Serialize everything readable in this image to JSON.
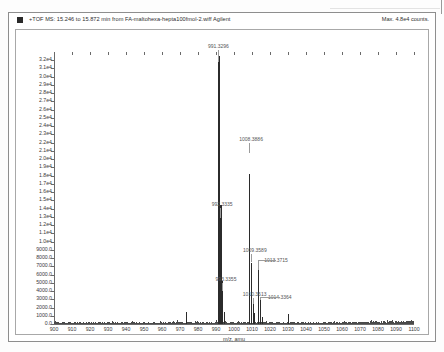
{
  "window": {
    "header": {
      "marker_icon": "filled-square-icon",
      "title": "+TOF MS: 15.246 to 15.872 min from FA-maltohexa-hepta100fmol-2.wiff Agilent",
      "max_counts": "Max. 4.8e4 counts."
    }
  },
  "chart_data": {
    "type": "line",
    "title": "+TOF MS: 15.246 to 15.872 min from FA-maltohexa-hepta100fmol-2.wiff Agilent",
    "subtitle": "Max. 4.8e4 counts.",
    "xlabel": "m/z, amu",
    "ylabel": "",
    "xlim": [
      900,
      1100
    ],
    "ylim": [
      0,
      33000
    ],
    "grid": false,
    "legend": "none",
    "x_ticks": [
      900,
      910,
      920,
      930,
      940,
      950,
      960,
      970,
      980,
      990,
      1000,
      1010,
      1020,
      1030,
      1040,
      1050,
      1060,
      1070,
      1080,
      1090,
      1100
    ],
    "y_ticks": [
      {
        "value": 0,
        "label": "0.0"
      },
      {
        "value": 1000,
        "label": "1000.0"
      },
      {
        "value": 2000,
        "label": "2000.0"
      },
      {
        "value": 3000,
        "label": "3000.0"
      },
      {
        "value": 4000,
        "label": "4000.0"
      },
      {
        "value": 5000,
        "label": "5000.0"
      },
      {
        "value": 6000,
        "label": "6000.0"
      },
      {
        "value": 7000,
        "label": "7000.0"
      },
      {
        "value": 8000,
        "label": "8000.0"
      },
      {
        "value": 9000,
        "label": "9000.0"
      },
      {
        "value": 10000,
        "label": "1.0e4"
      },
      {
        "value": 11000,
        "label": "1.1e4"
      },
      {
        "value": 12000,
        "label": "1.2e4"
      },
      {
        "value": 13000,
        "label": "1.3e4"
      },
      {
        "value": 14000,
        "label": "1.4e4"
      },
      {
        "value": 15000,
        "label": "1.5e4"
      },
      {
        "value": 16000,
        "label": "1.6e4"
      },
      {
        "value": 17000,
        "label": "1.7e4"
      },
      {
        "value": 18000,
        "label": "1.8e4"
      },
      {
        "value": 19000,
        "label": "1.9e4"
      },
      {
        "value": 20000,
        "label": "2.0e4"
      },
      {
        "value": 21000,
        "label": "2.1e4"
      },
      {
        "value": 22000,
        "label": "2.2e4"
      },
      {
        "value": 23000,
        "label": "2.3e4"
      },
      {
        "value": 24000,
        "label": "2.4e4"
      },
      {
        "value": 25000,
        "label": "2.5e4"
      },
      {
        "value": 26000,
        "label": "2.6e4"
      },
      {
        "value": 27000,
        "label": "2.7e4"
      },
      {
        "value": 28000,
        "label": "2.8e4"
      },
      {
        "value": 29000,
        "label": "2.9e4"
      },
      {
        "value": 30000,
        "label": "3.0e4"
      },
      {
        "value": 31000,
        "label": "3.1e4"
      },
      {
        "value": 32000,
        "label": "3.2e4"
      }
    ],
    "peaks": [
      {
        "mz": 973.3,
        "intensity": 1500,
        "label": null
      },
      {
        "mz": 991.3296,
        "intensity": 32500,
        "label": "991.3296"
      },
      {
        "mz": 992.3335,
        "intensity": 14400,
        "label": "992.3335"
      },
      {
        "mz": 993.3355,
        "intensity": 5200,
        "label": "993.3355"
      },
      {
        "mz": 994.33,
        "intensity": 1500,
        "label": null
      },
      {
        "mz": 1008.3886,
        "intensity": 18200,
        "label": "1008.3886"
      },
      {
        "mz": 1009.3589,
        "intensity": 7400,
        "label": "1009.3589"
      },
      {
        "mz": 1010.3613,
        "intensity": 3100,
        "label": "1010.3613"
      },
      {
        "mz": 1011.36,
        "intensity": 1300,
        "label": null
      },
      {
        "mz": 1013.3715,
        "intensity": 6600,
        "label": "1013.3715"
      },
      {
        "mz": 1014.3364,
        "intensity": 2900,
        "label": "1014.3364"
      },
      {
        "mz": 1015.34,
        "intensity": 900,
        "label": null
      },
      {
        "mz": 1030.2,
        "intensity": 1200,
        "label": null
      }
    ],
    "annotations": [
      "991.3296",
      "992.3335",
      "993.3355",
      "1008.3886",
      "1009.3589",
      "1010.3613",
      "1013.3715",
      "1014.3364"
    ],
    "baseline_note": "low-level chemical noise across 900-1100 rising slightly above 1050"
  }
}
